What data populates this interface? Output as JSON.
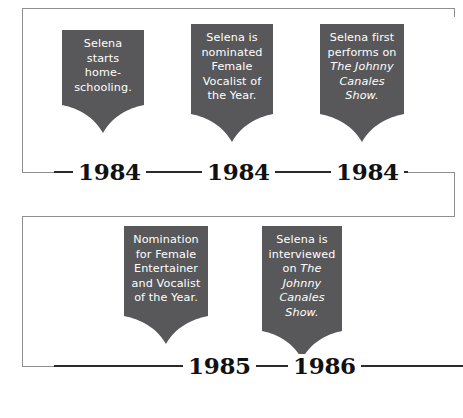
{
  "infographic": {
    "title": "Selena timeline",
    "accent_card_color": "#58585a",
    "line_color": "#8e8e90",
    "year_color": "#111113"
  },
  "rows": [
    {
      "name": "row-1984",
      "events": [
        {
          "year": "1984",
          "lines": [
            {
              "text": "Selena",
              "italic": false
            },
            {
              "text": "starts home-",
              "italic": false
            },
            {
              "text": "schooling.",
              "italic": false
            }
          ]
        },
        {
          "year": "1984",
          "lines": [
            {
              "text": "Selena is",
              "italic": false
            },
            {
              "text": "nominated",
              "italic": false
            },
            {
              "text": "Female",
              "italic": false
            },
            {
              "text": "Vocalist of",
              "italic": false
            },
            {
              "text": "the Year.",
              "italic": false
            }
          ]
        },
        {
          "year": "1984",
          "lines": [
            {
              "text": "Selena first",
              "italic": false
            },
            {
              "text": "performs on",
              "italic": false
            },
            {
              "text": "The Johnny",
              "italic": true
            },
            {
              "text": "Canales",
              "italic": true
            },
            {
              "text": "Show.",
              "italic": true
            }
          ]
        }
      ]
    },
    {
      "name": "row-1985-1986",
      "events": [
        {
          "year": "1985",
          "lines": [
            {
              "text": "Nomination",
              "italic": false
            },
            {
              "text": "for Female",
              "italic": false
            },
            {
              "text": "Entertainer",
              "italic": false
            },
            {
              "text": "and Vocalist",
              "italic": false
            },
            {
              "text": "of the Year.",
              "italic": false
            }
          ]
        },
        {
          "year": "1986",
          "lines": [
            {
              "text": "Selena is",
              "italic": false
            },
            {
              "text": "interviewed",
              "italic": false
            },
            {
              "text": "on ",
              "italic": false,
              "trail_italic": "The"
            },
            {
              "text": "Johnny",
              "italic": true
            },
            {
              "text": "Canales",
              "italic": true
            },
            {
              "text": "Show.",
              "italic": true
            }
          ]
        }
      ]
    }
  ]
}
